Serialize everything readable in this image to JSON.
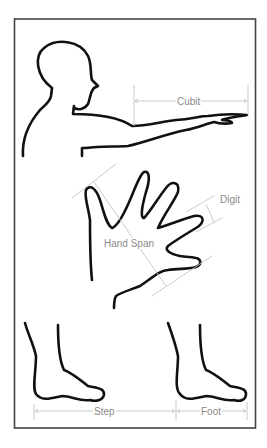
{
  "diagram": {
    "type": "body-measurement-illustration",
    "colors": {
      "background": "#ffffff",
      "outline": "#111111",
      "measure_lines": "#c4c4c4",
      "labels": "#8a8a8a",
      "frame": "#444444"
    },
    "labels": {
      "cubit": "Cubit",
      "digit": "Digit",
      "hand_span": "Hand Span",
      "step": "Step",
      "foot": "Foot"
    },
    "figures": [
      "head-and-outstretched-arm",
      "open-hand",
      "left-foot",
      "right-foot"
    ]
  }
}
